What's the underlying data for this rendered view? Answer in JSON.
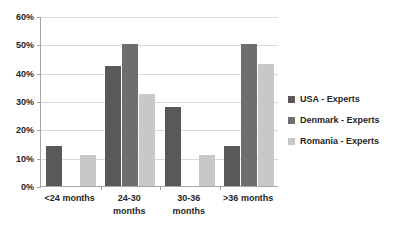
{
  "chart_data": {
    "type": "bar",
    "title": "",
    "subtitle": "",
    "xlabel": "",
    "ylabel": "",
    "ylim": [
      0,
      60
    ],
    "ytick_labels": [
      "0%",
      "10%",
      "20%",
      "30%",
      "40%",
      "50%",
      "60%"
    ],
    "ytick_values": [
      0,
      10,
      20,
      30,
      40,
      50,
      60
    ],
    "grid": true,
    "legend_position": "right",
    "categories": [
      "<24 months",
      "24-30 months",
      "30-36 months",
      ">36 months"
    ],
    "series": [
      {
        "name": "USA - Experts",
        "color": "#595959",
        "values": [
          14,
          42.5,
          28,
          14
        ]
      },
      {
        "name": "Denmark - Experts",
        "color": "#6e6e6e",
        "values": [
          null,
          50,
          null,
          50
        ]
      },
      {
        "name": "Romania - Experts",
        "color": "#c8c8c8",
        "values": [
          11,
          32.5,
          11,
          43
        ]
      }
    ]
  },
  "axis": {
    "gridline_color": "#d9d9d9",
    "axis_color": "#a6a6a6"
  },
  "category_label_lines": [
    [
      "<24 months"
    ],
    [
      "24-30",
      "months"
    ],
    [
      "30-36",
      "months"
    ],
    [
      ">36 months"
    ]
  ]
}
